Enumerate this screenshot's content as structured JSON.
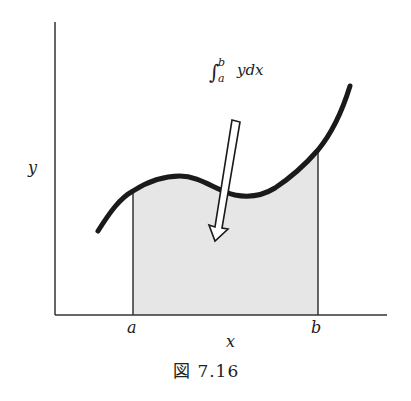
{
  "figure": {
    "caption": "図 7.16",
    "annotation": {
      "integral_symbol": "∫",
      "upper_limit": "b",
      "lower_limit": "a",
      "integrand": "ydx"
    },
    "axes": {
      "x_label": "x",
      "y_label": "y"
    },
    "interval_markers": {
      "a": "a",
      "b": "b"
    },
    "colors": {
      "curve": "#1a1a1a",
      "axes": "#333333",
      "shaded_area": "#e6e6e6",
      "arrow_fill": "#ffffff"
    }
  }
}
